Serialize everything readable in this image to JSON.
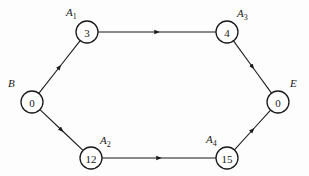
{
  "diagram": {
    "type": "network",
    "colors": {
      "stroke": "#1a1a1a",
      "background": "#fdfdfd",
      "node_fill": "#ffffff"
    },
    "nodes": [
      {
        "id": "B",
        "label": "B",
        "sub": "",
        "value": "0",
        "x": 32,
        "y": 102,
        "label_x": 8,
        "label_y": 87
      },
      {
        "id": "A1",
        "label": "A",
        "sub": "1",
        "value": "3",
        "x": 87,
        "y": 32,
        "label_x": 66,
        "label_y": 16
      },
      {
        "id": "A2",
        "label": "A",
        "sub": "2",
        "value": "12",
        "x": 91,
        "y": 158,
        "label_x": 100,
        "label_y": 144
      },
      {
        "id": "A3",
        "label": "A",
        "sub": "3",
        "value": "4",
        "x": 227,
        "y": 32,
        "label_x": 237,
        "label_y": 17
      },
      {
        "id": "A4",
        "label": "A",
        "sub": "4",
        "value": "15",
        "x": 227,
        "y": 158,
        "label_x": 206,
        "label_y": 143
      },
      {
        "id": "E",
        "label": "E",
        "sub": "",
        "value": "0",
        "x": 278,
        "y": 102,
        "label_x": 290,
        "label_y": 87
      }
    ],
    "edges": [
      {
        "from": "B",
        "to": "A1"
      },
      {
        "from": "B",
        "to": "A2"
      },
      {
        "from": "A1",
        "to": "A3"
      },
      {
        "from": "A2",
        "to": "A4"
      },
      {
        "from": "A3",
        "to": "E"
      },
      {
        "from": "A4",
        "to": "E"
      }
    ]
  }
}
